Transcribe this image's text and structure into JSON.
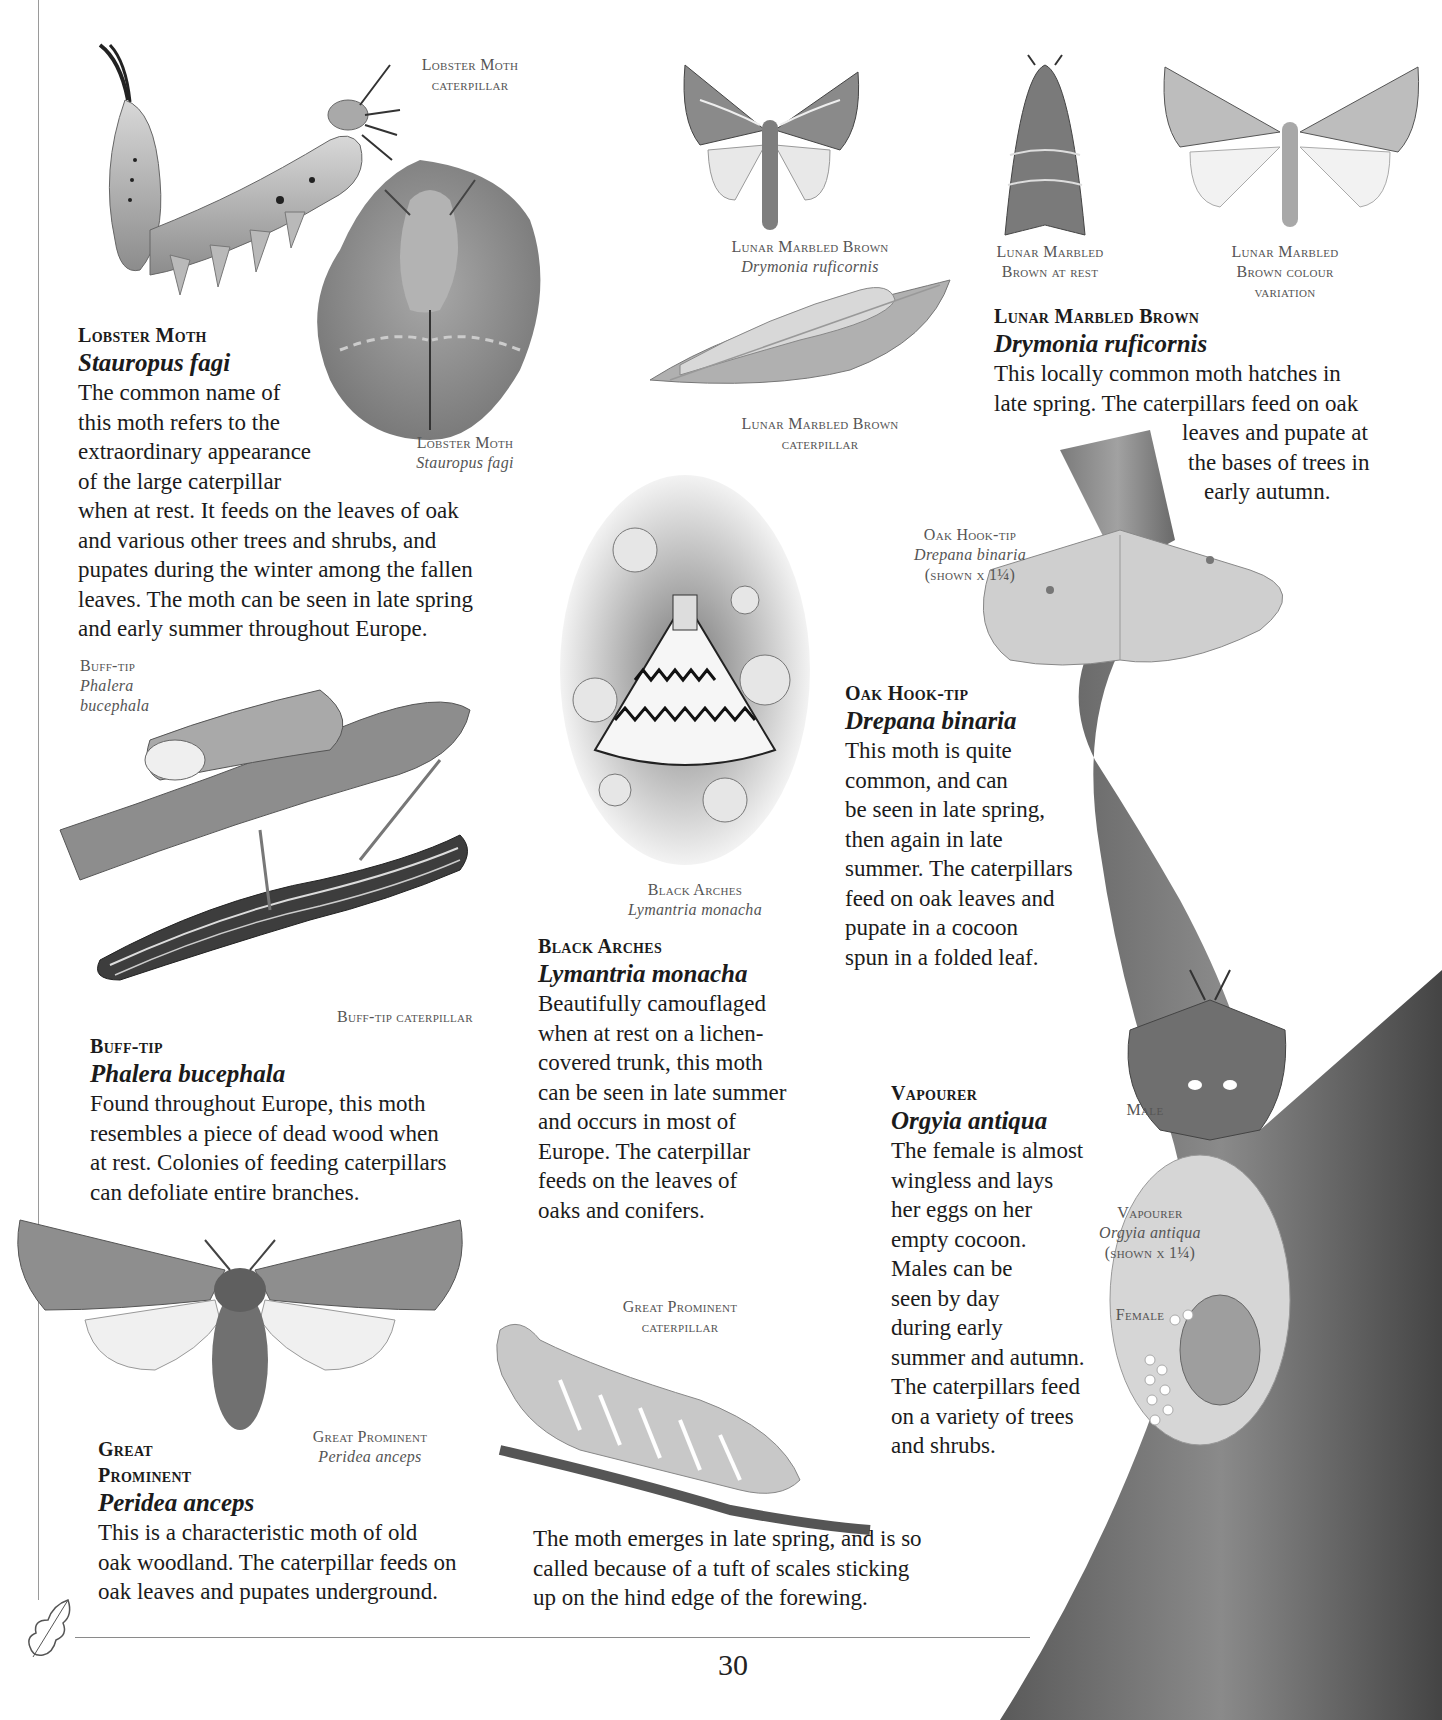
{
  "page": {
    "number": "30"
  },
  "captions": {
    "lobster_caterpillar": {
      "line1": "Lobster Moth",
      "line2": "caterpillar"
    },
    "lobster_moth": {
      "common": "Lobster Moth",
      "sci": "Stauropus fagi"
    },
    "lunar_main": {
      "common": "Lunar Marbled Brown",
      "sci": "Drymonia ruficornis"
    },
    "lunar_rest": {
      "line1": "Lunar Marbled",
      "line2": "Brown at rest"
    },
    "lunar_variation": {
      "line1": "Lunar Marbled",
      "line2": "Brown colour",
      "line3": "variation"
    },
    "lunar_caterpillar": {
      "line1": "Lunar Marbled Brown",
      "line2": "caterpillar"
    },
    "oak_hooktip": {
      "common": "Oak Hook-tip",
      "sci": "Drepana binaria",
      "scale": "(shown x 1¼)"
    },
    "buff_tip": {
      "common": "Buff-tip",
      "sci1": "Phalera",
      "sci2": "bucephala"
    },
    "buff_tip_caterpillar": {
      "line1": "Buff-tip caterpillar"
    },
    "black_arches": {
      "common": "Black Arches",
      "sci": "Lymantria monacha"
    },
    "vapourer_male": {
      "line1": "Male"
    },
    "vapourer": {
      "common": "Vapourer",
      "sci": "Orgyia antiqua",
      "scale": "(shown x 1¼)"
    },
    "vapourer_female": {
      "line1": "Female"
    },
    "great_prominent_caterpillar": {
      "line1": "Great Prominent",
      "line2": "caterpillar"
    },
    "great_prominent": {
      "common": "Great Prominent",
      "sci": "Peridea anceps"
    }
  },
  "entries": {
    "lobster": {
      "common": "Lobster Moth",
      "sci": "Stauropus fagi",
      "lines": [
        "The common name of",
        "this moth refers to the",
        "extraordinary appearance",
        "of the large caterpillar",
        "when at rest. It feeds on the leaves of oak",
        "and various other trees and shrubs, and",
        "pupates during the winter among the fallen",
        "leaves. The moth can be seen in late spring",
        "and early summer throughout Europe."
      ]
    },
    "lunar": {
      "common": "Lunar Marbled Brown",
      "sci": "Drymonia ruficornis",
      "lines": [
        "This locally common moth hatches in",
        "late spring. The caterpillars feed on oak",
        "leaves and pupate at",
        "the bases of trees in",
        "early autumn."
      ]
    },
    "oak_hooktip": {
      "common": "Oak Hook-tip",
      "sci": "Drepana binaria",
      "lines": [
        "This moth is quite",
        "common, and can",
        "be seen in late spring,",
        "then again in late",
        "summer. The caterpillars",
        "feed on oak leaves and",
        "pupate in a cocoon",
        "spun in a folded leaf."
      ]
    },
    "black_arches": {
      "common": "Black Arches",
      "sci": "Lymantria monacha",
      "lines": [
        "Beautifully camouflaged",
        "when at rest on a lichen-",
        "covered trunk, this moth",
        "can be seen in late summer",
        "and occurs in most of",
        "Europe. The caterpillar",
        "feeds on the leaves of",
        "oaks and conifers."
      ]
    },
    "buff_tip": {
      "common": "Buff-tip",
      "sci": "Phalera bucephala",
      "lines": [
        "Found throughout Europe, this moth",
        "resembles a piece of dead wood when",
        "at rest. Colonies of feeding caterpillars",
        "can defoliate entire branches."
      ]
    },
    "vapourer": {
      "common": "Vapourer",
      "sci": "Orgyia antiqua",
      "lines": [
        "The female is almost",
        "wingless and lays",
        "her eggs on her",
        "empty cocoon.",
        "Males can be",
        "seen by day",
        "during early",
        "summer and autumn.",
        "The caterpillars feed",
        "on a variety of trees",
        "and shrubs."
      ]
    },
    "great_prominent": {
      "common1": "Great",
      "common2": "Prominent",
      "sci": "Peridea anceps",
      "lines": [
        "This is a characteristic moth of old",
        "oak woodland. The caterpillar feeds on",
        "oak leaves and pupates underground."
      ],
      "continued": [
        "The moth emerges in late spring, and is so",
        "called because of a tuft of scales sticking",
        "up on the hind edge of the forewing."
      ]
    }
  },
  "colors": {
    "text": "#1b1b1b",
    "caption": "#555555",
    "rule": "#8a8a8a",
    "bark_dark": "#4a4a4a",
    "bark_mid": "#7a7a7a"
  }
}
